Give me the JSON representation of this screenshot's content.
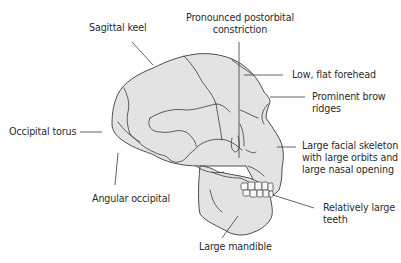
{
  "diagram": {
    "colors": {
      "bone_fill": "#e3e3e3",
      "outline": "#3a3a3a",
      "text": "#2b2b2b",
      "background": "#ffffff"
    },
    "labels": {
      "sagittal_keel": "Sagittal keel",
      "postorbital_line1": "Pronounced postorbital",
      "postorbital_line2": "constriction",
      "forehead": "Low, flat forehead",
      "brow_line1": "Prominent brow",
      "brow_line2": "ridges",
      "occipital_torus": "Occipital torus",
      "facial_line1": "Large facial skeleton",
      "facial_line2": "with large orbits and",
      "facial_line3": "large nasal opening",
      "angular_occipital": "Angular occipital",
      "teeth_line1": "Relatively large",
      "teeth_line2": "teeth",
      "mandible": "Large mandible"
    }
  }
}
